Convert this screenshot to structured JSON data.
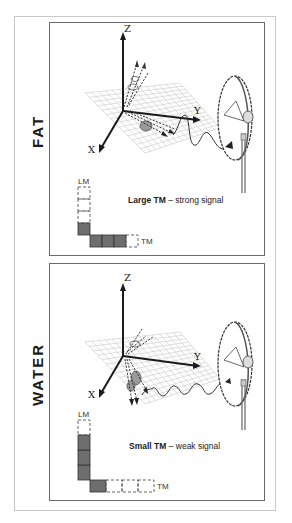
{
  "figure": "MRI signal: fat vs water magnetization",
  "colors": {
    "axis": "#1a1a1a",
    "grid": "#c8c8c8",
    "filled_box": "#6e6e6e",
    "dashed_box": "#555555",
    "frame": "#6a6a6a"
  },
  "panels": [
    {
      "id": "fat",
      "side_label": "FAT",
      "axes": {
        "z": "Z",
        "y": "Y",
        "x": "X"
      },
      "caption_bold": "Large TM",
      "caption_rest": " – strong signal",
      "lm_label": "LM",
      "tm_label": "TM",
      "lm_filled_units": 1,
      "lm_total_units": 4,
      "tm_filled_units": 3,
      "tm_total_units": 4,
      "icons": [
        "coordinate-axes-icon",
        "grid-plane-icon",
        "spin-vector-icon",
        "signal-wave-icon",
        "antenna-dish-icon"
      ]
    },
    {
      "id": "water",
      "side_label": "WATER",
      "axes": {
        "z": "Z",
        "y": "Y",
        "x": "X"
      },
      "caption_bold": "Small TM",
      "caption_rest": " – weak signal",
      "lm_label": "LM",
      "tm_label": "TM",
      "lm_filled_units": 3,
      "lm_total_units": 4,
      "tm_filled_units": 1,
      "tm_total_units": 4,
      "icons": [
        "coordinate-axes-icon",
        "grid-plane-icon",
        "spin-vector-icon",
        "signal-wave-icon",
        "antenna-dish-icon"
      ]
    }
  ]
}
